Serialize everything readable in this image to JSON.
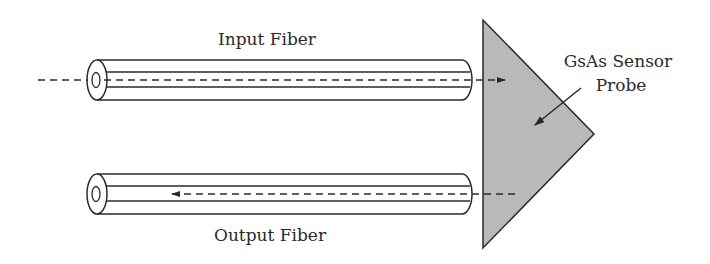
{
  "labels": {
    "input_fiber": "Input Fiber",
    "output_fiber": "Output Fiber",
    "sensor_line1": "GsAs Sensor",
    "sensor_line2": "Probe"
  },
  "colors": {
    "line": "#2a2a2a",
    "probe_fill": "#b9b9b9",
    "background": "#ffffff"
  },
  "components": [
    {
      "name": "input-fiber",
      "direction": "toward probe"
    },
    {
      "name": "output-fiber",
      "direction": "away from probe"
    },
    {
      "name": "gsas-sensor-probe",
      "shape": "triangle"
    }
  ]
}
